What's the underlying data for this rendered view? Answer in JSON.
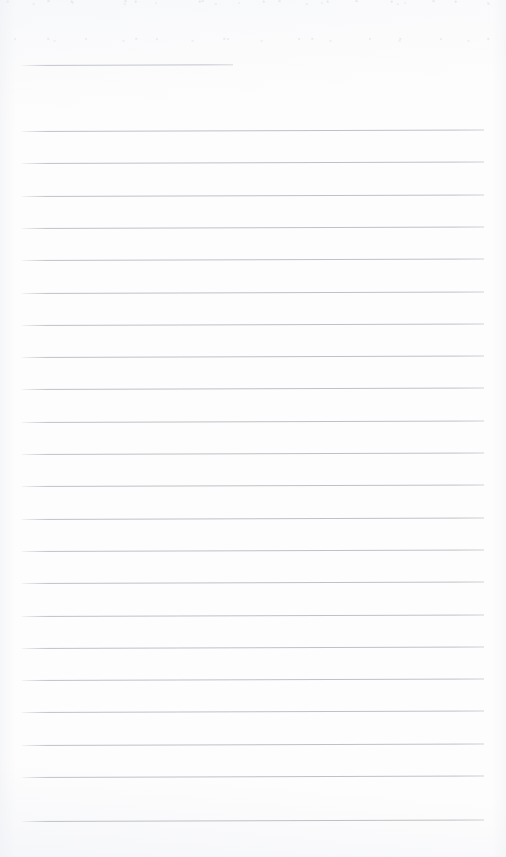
{
  "document": {
    "kind": "lined-paper-scan",
    "title": "Blank ruled notebook page",
    "page_width": 506,
    "page_height": 857,
    "page_color": "#fdfdfd",
    "rule_color": "#b9bcc4",
    "rule_thickness_px": 1,
    "rule_skew_deg": -0.18,
    "content_text": "",
    "written_text": "",
    "visible_labels": []
  },
  "header_rule": {
    "name": "header-rule",
    "x": 22,
    "y": 65,
    "width": 211,
    "note": "short rule near top, ends well before right margin"
  },
  "body_rules": {
    "count": 22,
    "left_x": 22,
    "right_x": 484,
    "width": 462,
    "first_y": 131,
    "spacing_px": 32.3,
    "y_positions": [
      131,
      163.3,
      195.6,
      227.9,
      260.2,
      292.5,
      324.8,
      357.1,
      389.4,
      421.7,
      454.0,
      486.3,
      518.6,
      550.9,
      583.2,
      615.5,
      647.8,
      680.1,
      712.4,
      744.7,
      777.0,
      821.0
    ]
  }
}
